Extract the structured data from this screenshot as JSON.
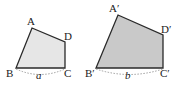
{
  "figure": {
    "colors": {
      "stroke": "#2a2a2a",
      "small_fill": "#e6e6e6",
      "large_fill": "#c9c9c9",
      "dash": "#888888"
    },
    "small_quad": {
      "labels": {
        "A": "A",
        "B": "B",
        "C": "C",
        "D": "D"
      },
      "side_label": "a"
    },
    "large_quad": {
      "labels": {
        "A": "A′",
        "B": "B′",
        "C": "C′",
        "D": "D′"
      },
      "side_label": "b"
    }
  }
}
